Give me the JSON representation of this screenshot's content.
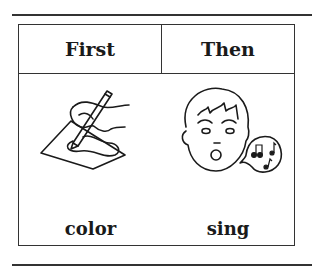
{
  "board": {
    "columns": [
      {
        "header": "First",
        "activity": "color",
        "icon": "coloring-icon"
      },
      {
        "header": "Then",
        "activity": "sing",
        "icon": "singing-icon"
      }
    ]
  },
  "colors": {
    "ink": "#1a1a1a",
    "rule": "#333333",
    "background": "#ffffff"
  }
}
